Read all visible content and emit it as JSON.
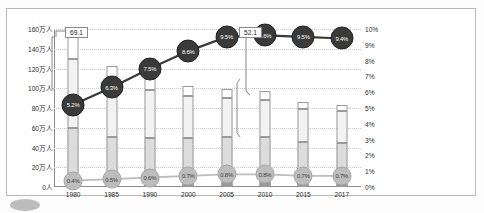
{
  "chart_data": {
    "type": "bar",
    "title": "",
    "subtitle": "",
    "xlabel": "",
    "ylabel": "",
    "y2label": "",
    "grid": true,
    "legend_position": "right",
    "categories": [
      "1980",
      "1985",
      "1990",
      "2000",
      "2005",
      "2010",
      "2015",
      "2017"
    ],
    "ylim": [
      0,
      1600000
    ],
    "ylim2": [
      0,
      10
    ],
    "ytick_labels": [
      "0人",
      "20万人",
      "40万人",
      "60万人",
      "80万人",
      "100万人",
      "120万人",
      "140万人",
      "160万人"
    ],
    "ytick_values": [
      0,
      200000,
      400000,
      600000,
      800000,
      1000000,
      1200000,
      1400000,
      1600000
    ],
    "y2tick_labels": [
      "0%",
      "1%",
      "2%",
      "3%",
      "4%",
      "5%",
      "6%",
      "7%",
      "8%",
      "9%",
      "10%"
    ],
    "y2tick_values": [
      0,
      1,
      2,
      3,
      4,
      5,
      6,
      7,
      8,
      9,
      10
    ],
    "series": [
      {
        "name": "3.5kg以上",
        "kind": "bar-segment",
        "swatch": "#ffffff",
        "values": [
          310000,
          190000,
          155000,
          100000,
          90000,
          85000,
          72000,
          70000
        ]
      },
      {
        "name": "3.0〜3.5",
        "kind": "bar-segment",
        "swatch": "#f2f2f2",
        "values": [
          700000,
          530000,
          490000,
          420000,
          390000,
          380000,
          330000,
          320000
        ]
      },
      {
        "name": "2.5〜3.0",
        "kind": "bar-segment",
        "swatch": "#dcdcdc",
        "values": [
          490000,
          410000,
          400000,
          390000,
          390000,
          390000,
          350000,
          340000
        ]
      },
      {
        "name": "2.0〜2.5",
        "kind": "bar-segment",
        "swatch": "#b5b5b5",
        "values": [
          63000,
          54000,
          55000,
          70000,
          78000,
          75000,
          67000,
          65000
        ]
      },
      {
        "name": "1.5〜2.0",
        "kind": "bar-segment",
        "swatch": "#8f8f8f",
        "values": [
          14000,
          12000,
          12000,
          14000,
          15000,
          15000,
          13000,
          13000
        ]
      },
      {
        "name": "1.5kg未満",
        "kind": "bar-segment",
        "swatch": "#5a5a5a",
        "values": [
          6000,
          6000,
          7000,
          8000,
          9000,
          9000,
          8000,
          8000
        ]
      },
      {
        "name": "2,500g未満児の割合",
        "kind": "line",
        "swatch": "#3a3a3a",
        "axis": "right",
        "values": [
          5.2,
          6.3,
          7.5,
          8.6,
          9.5,
          9.6,
          9.5,
          9.4
        ],
        "labels": [
          "5.2%",
          "6.3%",
          "7.5%",
          "8.6%",
          "9.5%",
          "9.6%",
          "9.5%",
          "9.4%"
        ]
      },
      {
        "name": "1,500g未満児の割合",
        "kind": "line",
        "swatch": "#bdbdbd",
        "axis": "right",
        "values": [
          0.4,
          0.5,
          0.6,
          0.7,
          0.8,
          0.8,
          0.7,
          0.7
        ],
        "labels": [
          "0.4%",
          "0.5%",
          "0.6%",
          "0.7%",
          "0.8%",
          "0.8%",
          "0.7%",
          "0.7%"
        ]
      }
    ],
    "totals": [
      1577000,
      1432000,
      1222000,
      1191000,
      1063000,
      1071000,
      1006000,
      946000
    ],
    "annotations": [
      {
        "id": "callout-left",
        "text": "69.1",
        "target_category": "1980"
      },
      {
        "id": "callout-right",
        "text": "52.1",
        "target_category": "2010"
      }
    ]
  },
  "legend": {
    "items": [
      {
        "label": "3.5kg以上",
        "shape": "square",
        "color": "#ffffff"
      },
      {
        "label": "3.0〜3.5",
        "shape": "square",
        "color": "#f2f2f2"
      },
      {
        "label": "2.5〜3.0",
        "shape": "square",
        "color": "#dcdcdc"
      },
      {
        "label": "2.0〜2.5",
        "shape": "square",
        "color": "#b5b5b5"
      },
      {
        "label": "1.5〜2.0",
        "shape": "square",
        "color": "#8f8f8f"
      },
      {
        "label": "1.5kg未満",
        "shape": "square",
        "color": "#5a5a5a"
      },
      {
        "label": "2,500g未満児の割合",
        "shape": "circle",
        "color": "#3a3a3a"
      },
      {
        "label": "1,500g未満児の割合",
        "shape": "circle",
        "color": "#bdbdbd"
      }
    ]
  }
}
